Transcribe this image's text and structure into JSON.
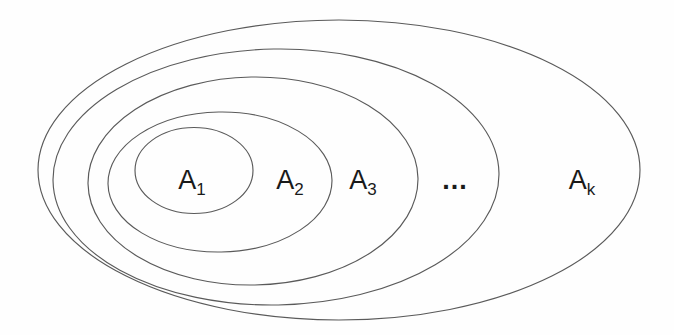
{
  "diagram": {
    "kind": "nested-set-ellipses",
    "canvas": {
      "width": 674,
      "height": 335
    },
    "colors": {
      "background": "#fefefe",
      "stroke": "#5a5a5a",
      "text": "#1a1a1a"
    },
    "stroke_width": 1.15,
    "ellipses": [
      {
        "id": "A1",
        "cx": 194,
        "cy": 170.5,
        "rx": 59,
        "ry": 43,
        "rotate": 0
      },
      {
        "id": "A2",
        "cx": 220,
        "cy": 182,
        "rx": 112,
        "ry": 70,
        "rotate": -1
      },
      {
        "id": "A3",
        "cx": 253,
        "cy": 181,
        "rx": 165,
        "ry": 104,
        "rotate": -1
      },
      {
        "id": "A4",
        "cx": 276,
        "cy": 177,
        "rx": 223,
        "ry": 128,
        "rotate": -1
      },
      {
        "id": "Ak",
        "cx": 339,
        "cy": 170,
        "rx": 301,
        "ry": 150,
        "rotate": 0
      }
    ],
    "labels": [
      {
        "id": "A1",
        "base": "A",
        "sub": "1",
        "x": 192,
        "y": 189
      },
      {
        "id": "A2",
        "base": "A",
        "sub": "2",
        "x": 290,
        "y": 189
      },
      {
        "id": "A3",
        "base": "A",
        "sub": "3",
        "x": 363,
        "y": 189
      },
      {
        "id": "Ak",
        "base": "A",
        "sub": "k",
        "x": 582,
        "y": 189
      }
    ],
    "ellipsis": {
      "text": "...",
      "x": 455,
      "y": 189
    }
  }
}
